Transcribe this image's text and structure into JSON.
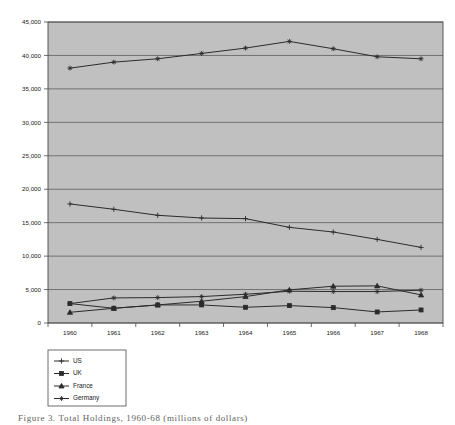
{
  "figure": {
    "caption": "Figure 3. Total Holdings, 1960-68 (millions of dollars)",
    "plot_bg_color": "#c0c0c0",
    "grid_color": "#555555",
    "border_color": "#4a4a4a",
    "line_color": "#2b2b2b",
    "text_color": "#1a1a1a"
  },
  "chart_data": {
    "type": "line",
    "title": "",
    "xlabel": "",
    "ylabel": "",
    "categories": [
      "1960",
      "1961",
      "1962",
      "1963",
      "1964",
      "1965",
      "1966",
      "1967",
      "1968"
    ],
    "x": [
      1960,
      1961,
      1962,
      1963,
      1964,
      1965,
      1966,
      1967,
      1968
    ],
    "ylim": [
      0,
      45000
    ],
    "ytick_labels": [
      "0",
      "5,000",
      "10,000",
      "15,000",
      "20,000",
      "25,000",
      "30,000",
      "35,000",
      "40,000",
      "45,000"
    ],
    "ytick_values": [
      0,
      5000,
      10000,
      15000,
      20000,
      25000,
      30000,
      35000,
      40000,
      45000
    ],
    "xtick_labels": [
      "1960",
      "1961",
      "1962",
      "1963",
      "1964",
      "1965",
      "1966",
      "1967",
      "1968"
    ],
    "grid": true,
    "grid_axis": "y",
    "legend_position": "below-left",
    "series": [
      {
        "name": "US",
        "marker": "plus",
        "values": [
          17800,
          17000,
          16100,
          15700,
          15600,
          14300,
          13600,
          12500,
          11300
        ]
      },
      {
        "name": "UK",
        "marker": "square",
        "values": [
          2900,
          2200,
          2700,
          2700,
          2350,
          2600,
          2300,
          1650,
          1950
        ]
      },
      {
        "name": "France",
        "marker": "triangle",
        "values": [
          1600,
          2200,
          2700,
          3250,
          3950,
          4950,
          5500,
          5550,
          4200
        ]
      },
      {
        "name": "Germany",
        "marker": "cross",
        "values": [
          2900,
          3750,
          3800,
          3950,
          4300,
          4750,
          4700,
          4700,
          4900
        ]
      },
      {
        "name": "GermanyTop",
        "marker": "cross",
        "values": [
          38100,
          39000,
          39500,
          40300,
          41100,
          42100,
          41000,
          39800,
          39500
        ]
      }
    ],
    "legend": [
      {
        "label": "US",
        "marker": "plus"
      },
      {
        "label": "UK",
        "marker": "square"
      },
      {
        "label": "France",
        "marker": "triangle"
      },
      {
        "label": "Germany",
        "marker": "cross"
      }
    ]
  }
}
